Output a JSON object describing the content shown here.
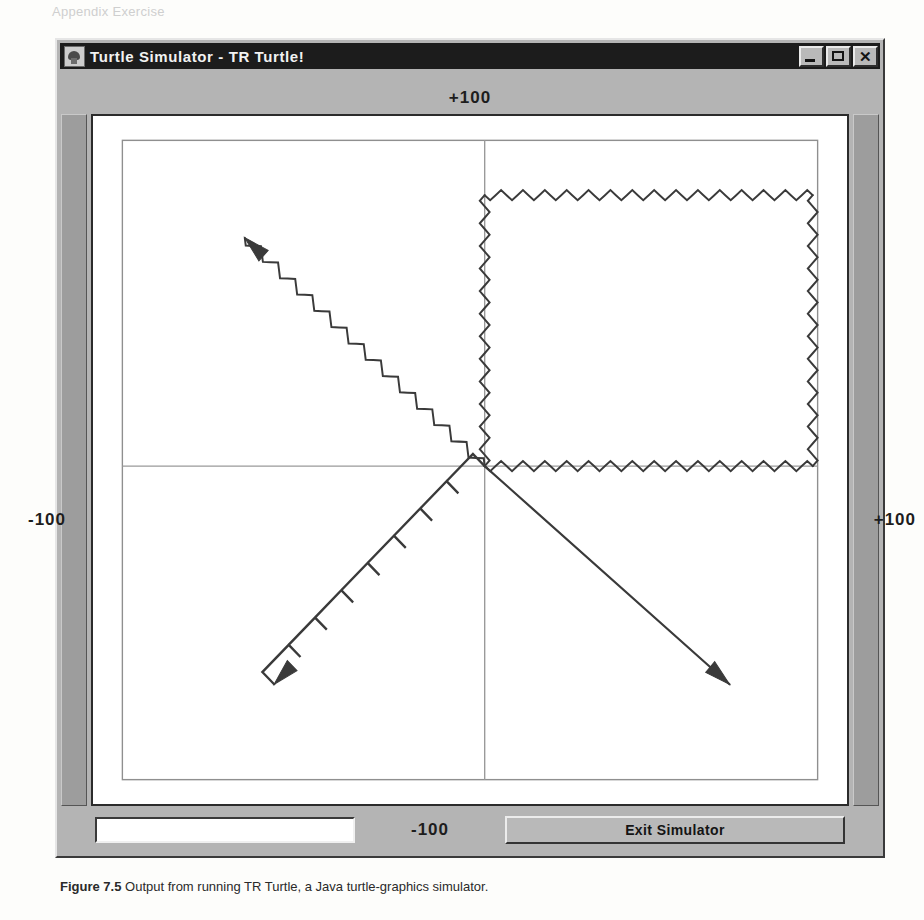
{
  "window": {
    "title": "Turtle Simulator - TR Turtle!",
    "icon": "turtle-app-icon",
    "controls": {
      "minimize": "minimize-icon",
      "maximize": "maximize-icon",
      "close": "✕"
    }
  },
  "axis_labels": {
    "top": "+100",
    "left": "-100",
    "right": "+100",
    "bottom": "-100"
  },
  "bottom_bar": {
    "command_value": "",
    "command_placeholder": "",
    "exit_label": "Exit Simulator"
  },
  "caption": {
    "figure": "Figure 7.5",
    "text": "Output from running TR Turtle, a Java turtle-graphics simulator."
  },
  "bleed_text": {
    "a": "Appendix Exercise",
    "b": "G",
    "c": "TR",
    "d": "S",
    "e": "V",
    "f": "of the pencil",
    "g": "having to create a new"
  },
  "colors": {
    "window_face": "#b4b4b4",
    "titlebar": "#1c1c1c",
    "titlebar_text": "#f2f2f2",
    "canvas": "#ffffff",
    "ink": "#3a3a3a",
    "axis": "#9a9a9a",
    "rail": "#9d9d9d"
  },
  "drawing": {
    "description": "turtle-graphics output: zigzag square in quadrant I, zigzag arrow to upper-left, coarse sawtooth arrow to lower-left, straight arrow to lower-right",
    "origin": {
      "x": 400,
      "y": 345
    },
    "axes": {
      "vertical_x": 400,
      "horizontal_y": 345
    },
    "inner_border": {
      "x": 30,
      "y": 24,
      "width": 710,
      "height": 630
    },
    "paths": [
      {
        "name": "zigzag-square",
        "style": "fine-sawtooth",
        "amplitude": 5,
        "wavelength": 11,
        "segments": [
          {
            "from": [
              400,
              345
            ],
            "to": [
              400,
              78
            ]
          },
          {
            "from": [
              400,
              78
            ],
            "to": [
              735,
              78
            ]
          },
          {
            "from": [
              735,
              78
            ],
            "to": [
              735,
              345
            ]
          },
          {
            "from": [
              735,
              345
            ],
            "to": [
              400,
              345
            ]
          }
        ],
        "arrow": false
      },
      {
        "name": "zigzag-arrow-upper-left",
        "style": "fine-sawtooth",
        "amplitude": 5,
        "wavelength": 12,
        "segments": [
          {
            "from": [
              400,
              345
            ],
            "to": [
              155,
              120
            ]
          }
        ],
        "arrow": true
      },
      {
        "name": "sawtooth-arrow-lower-left",
        "style": "coarse-sawtooth",
        "amplitude": 17,
        "wavelength": 36,
        "segments": [
          {
            "from": [
              400,
              345
            ],
            "to": [
              185,
              560
            ]
          }
        ],
        "arrow": true
      },
      {
        "name": "straight-arrow-lower-right",
        "style": "straight",
        "segments": [
          {
            "from": [
              400,
              345
            ],
            "to": [
              650,
              560
            ]
          }
        ],
        "arrow": true
      }
    ]
  }
}
